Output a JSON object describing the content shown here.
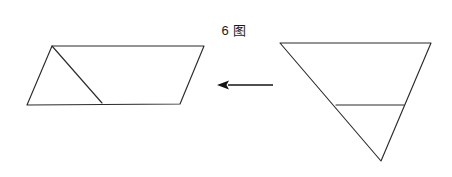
{
  "figure": {
    "caption_number": "6",
    "caption_word": "图",
    "caption_full": "6 图",
    "background_color": "#ffffff",
    "stroke_color": "#2b2b2b",
    "arrow_color": "#131313",
    "width": 452,
    "height": 177
  },
  "shapes": {
    "left": {
      "name": "parallelogram",
      "label": "parallelogram-result",
      "vertices": [
        [
          52,
          46
        ],
        [
          204,
          46
        ],
        [
          180,
          104
        ],
        [
          27,
          105
        ]
      ],
      "internal_line": {
        "name": "diagonal-cut-line",
        "from": [
          52,
          46
        ],
        "to": [
          102,
          103
        ]
      }
    },
    "right": {
      "name": "inverted-triangle",
      "label": "triangle-source",
      "vertices": [
        [
          280,
          43
        ],
        [
          431,
          43
        ],
        [
          381,
          161
        ]
      ],
      "internal_line": {
        "name": "horizontal-cut-line",
        "from": [
          336,
          105
        ],
        "to": [
          404,
          105
        ]
      }
    }
  },
  "arrow": {
    "name": "transform-arrow",
    "direction": "left",
    "tail": [
      273,
      85
    ],
    "tip": [
      217,
      85
    ],
    "head_half_height": 4.6,
    "head_length": 11
  }
}
